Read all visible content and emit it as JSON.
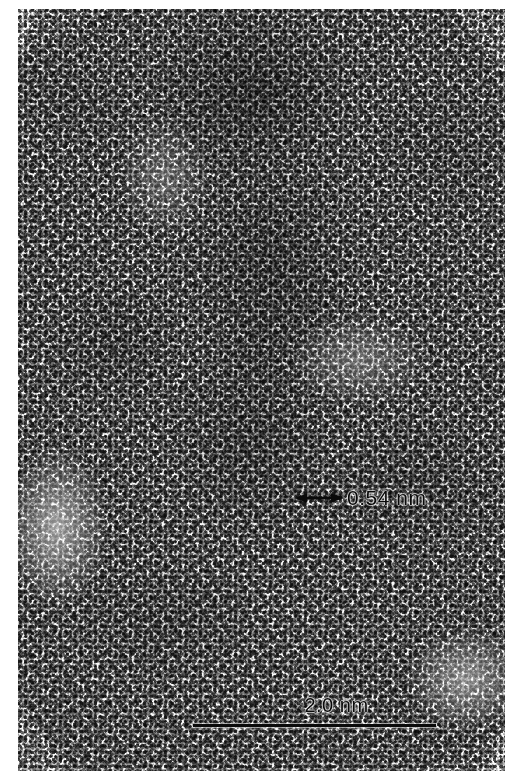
{
  "figure": {
    "kind": "hrtem-micrograph",
    "caption_text": "",
    "background_color": "#ffffff",
    "ink_color": "#0a0a0a",
    "width_px": 513,
    "height_px": 783
  },
  "plate": {
    "name": "tem-image-plate",
    "left_px": 18,
    "top_px": 9,
    "width_px": 487,
    "height_px": 762,
    "description": "Halftone-printed high-resolution transmission electron microscopy image showing granular amorphous contrast with a darker particle region and vertical lattice fringes near the centre."
  },
  "annotations": {
    "d_spacing": {
      "name": "d-spacing-annotation",
      "label": "0.54 nm",
      "value": 0.54,
      "unit": "nm",
      "marker": "double-headed-arrow",
      "left_px": 276,
      "top_px": 478,
      "arrow_length_px": 50
    },
    "scale_bar": {
      "name": "scale-bar",
      "label": "2.0 nm",
      "value": 2.0,
      "unit": "nm",
      "left_px": 175,
      "top_px": 686,
      "bar_length_px": 243,
      "bar_thickness_px": 3
    }
  }
}
